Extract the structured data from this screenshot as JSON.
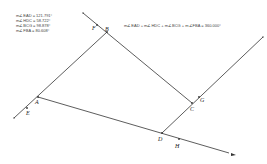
{
  "measurements": [
    {
      "label": "m∠EAD = 121.791°"
    },
    {
      "label": "m∠HDC = 58.722°"
    },
    {
      "label": "m∠BCG = 98.878°"
    },
    {
      "label": "m∠FBA = 80.608°"
    }
  ],
  "sum_equation": "m∠EAD + m∠HDC + m∠BCG + m∠FBA = 360.000°",
  "points": {
    "A": {
      "label": "A",
      "x": 38,
      "y": 97
    },
    "B": {
      "label": "B",
      "x": 107,
      "y": 32
    },
    "C": {
      "label": "C",
      "x": 192,
      "y": 103
    },
    "D": {
      "label": "D",
      "x": 162,
      "y": 133
    },
    "E": {
      "label": "E",
      "x": 27,
      "y": 108
    },
    "F": {
      "label": "F",
      "x": 97,
      "y": 25
    },
    "G": {
      "label": "G",
      "x": 199,
      "y": 97
    },
    "H": {
      "label": "H",
      "x": 179,
      "y": 139
    }
  },
  "colors": {
    "line": "#333333",
    "text": "#444444",
    "background": "#ffffff"
  }
}
